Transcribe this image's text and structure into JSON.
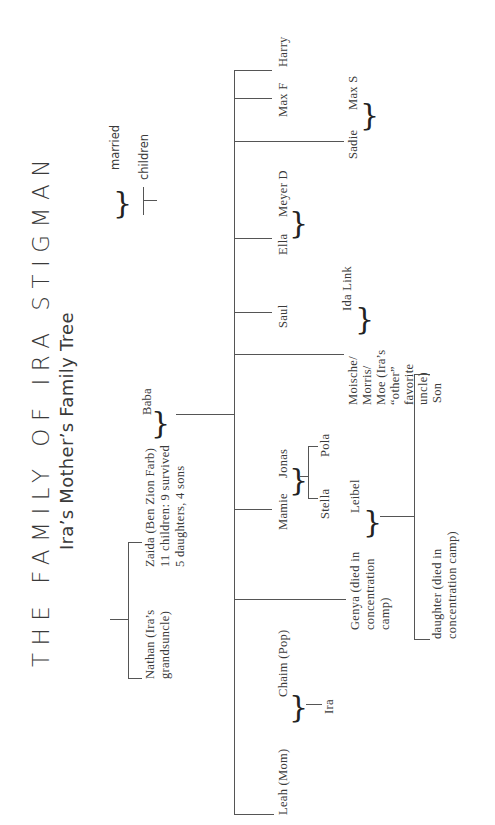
{
  "header": {
    "title": "THE FAMILY OF IRA STIGMAN",
    "subtitle": "Ira’s Mother’s Family Tree"
  },
  "legend": {
    "married_label": "married",
    "children_label": "children",
    "married_icon": "brace-icon",
    "children_icon": "tee-icon"
  },
  "tree": {
    "grandparents": {
      "nathan": [
        "Nathan (Ira’s",
        "grandsuncle)"
      ],
      "zaida": [
        "Zaida (Ben Zion Farb)",
        "11 children: 9 survived",
        "5 daughters, 4 sons"
      ],
      "baba": "Baba"
    },
    "children": [
      {
        "name": "Leah (Mom)",
        "spouse": "Chaim (Pop)",
        "kids": [
          "Ira"
        ]
      },
      {
        "name_lines": [
          "Genya (died in",
          "concentration",
          "camp)"
        ],
        "spouse": "Leibel",
        "kids": [
          [
            "daughter (died in",
            "concentration camp)"
          ],
          [
            "Son"
          ]
        ]
      },
      {
        "name": "Mamie",
        "spouse": "Jonas",
        "kids": [
          "Stella",
          "Pola"
        ]
      },
      {
        "name_lines": [
          "Moische/",
          "Morris/",
          "Moe (Ira’s",
          "“other”",
          "favorite",
          "uncle)"
        ],
        "spouse": "Ida Link"
      },
      {
        "name": "Saul"
      },
      {
        "name": "Ella",
        "spouse": "Meyer D"
      },
      {
        "name": "Sadie",
        "spouse": "Max S"
      },
      {
        "name": "Max F"
      },
      {
        "name": "Harry"
      }
    ]
  }
}
